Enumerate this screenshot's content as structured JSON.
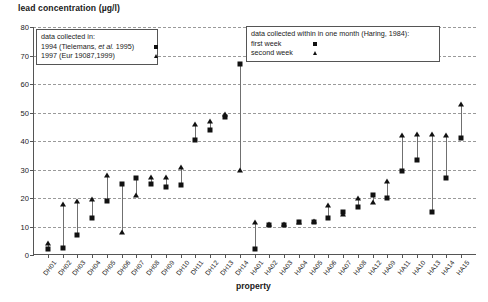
{
  "chart_data": {
    "type": "scatter",
    "title": "",
    "ylabel": "lead concentration (µg/l)",
    "xlabel": "property",
    "ylim": [
      0,
      80
    ],
    "yticks": [
      0,
      10,
      20,
      30,
      40,
      50,
      60,
      70,
      80
    ],
    "grid": true,
    "legend_position": "inside-top",
    "categories": [
      "DH01",
      "DH02",
      "DH03",
      "DH04",
      "DH05",
      "DH06",
      "DH07",
      "DH08",
      "DH09",
      "DH10",
      "DH11",
      "DH12",
      "DH13",
      "DH14",
      "HA01",
      "HA02",
      "HA03",
      "HA04",
      "HA05",
      "HA06",
      "HA07",
      "HA08",
      "HA12",
      "HA09",
      "HA11",
      "HA10",
      "HA13",
      "HA14",
      "HA15"
    ],
    "series": [
      {
        "name": "square",
        "marker": "square",
        "values": [
          2.0,
          2.5,
          7.0,
          13.0,
          19.0,
          24.8,
          27.0,
          25.0,
          24.0,
          24.5,
          40.5,
          44.0,
          48.5,
          67.0,
          2.0,
          10.5,
          10.5,
          11.5,
          11.5,
          13.0,
          15.0,
          17.0,
          21.0,
          20.0,
          29.5,
          33.5,
          15.0,
          27.0,
          41.0
        ]
      },
      {
        "name": "triangle",
        "marker": "triangle",
        "values": [
          4.3,
          18.0,
          19.0,
          19.5,
          28.0,
          8.0,
          21.0,
          27.5,
          27.5,
          31.0,
          46.0,
          47.0,
          49.5,
          30.0,
          11.5,
          11.0,
          11.0,
          11.5,
          12.0,
          17.5,
          14.5,
          20.0,
          18.5,
          26.0,
          42.0,
          42.5,
          42.5,
          42.0,
          53.0
        ]
      }
    ]
  },
  "legend_left": {
    "title": "data collected in:",
    "rows": [
      {
        "label_pre": "1994 (Tielemans, ",
        "label_ital": "et al.",
        "label_post": " 1995)",
        "marker": "square"
      },
      {
        "label_pre": "1997 (Eur 19087,1999)",
        "label_ital": "",
        "label_post": "",
        "marker": "triangle"
      }
    ]
  },
  "legend_right": {
    "title": "data collected within in one month (Haring, 1984):",
    "rows": [
      {
        "label": "first week",
        "marker": "square"
      },
      {
        "label": "second week",
        "marker": "triangle"
      }
    ]
  }
}
